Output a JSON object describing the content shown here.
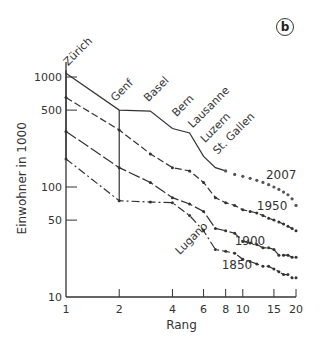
{
  "panel_label": "b",
  "chart_data": {
    "type": "line",
    "title": "",
    "xlabel": "Rang",
    "ylabel": "Einwohner in 1000",
    "x_scale": "log",
    "y_scale": "log",
    "xlim": [
      1,
      20
    ],
    "ylim": [
      10,
      1000
    ],
    "grid": false,
    "x_ticks": [
      1,
      2,
      4,
      6,
      8,
      10,
      15,
      20
    ],
    "x_tick_labels": [
      "1",
      "2",
      "4",
      "6",
      "8",
      "10",
      "15",
      "20"
    ],
    "y_ticks": [
      10,
      50,
      100,
      500,
      1000
    ],
    "y_tick_labels": [
      "10",
      "50",
      "100",
      "500",
      "1000"
    ],
    "x": [
      1,
      2,
      3,
      4,
      5,
      6,
      7,
      8,
      9,
      10,
      11,
      12,
      13,
      14,
      15,
      16,
      17,
      18,
      19,
      20
    ],
    "series": [
      {
        "name": "2007",
        "style": "solid-then-dotted",
        "values": [
          1080,
          500,
          490,
          340,
          310,
          190,
          150,
          140,
          130,
          125,
          120,
          115,
          110,
          105,
          100,
          95,
          90,
          85,
          78,
          68
        ]
      },
      {
        "name": "1950",
        "style": "dashed",
        "values": [
          650,
          330,
          200,
          150,
          140,
          110,
          80,
          72,
          68,
          62,
          60,
          58,
          55,
          52,
          50,
          48,
          46,
          44,
          42,
          40
        ]
      },
      {
        "name": "1900",
        "style": "long-dash",
        "values": [
          320,
          150,
          110,
          80,
          70,
          60,
          42,
          40,
          38,
          32,
          31,
          30,
          28,
          28,
          27,
          24,
          24,
          24,
          23,
          23
        ]
      },
      {
        "name": "1850",
        "style": "dash-dot",
        "values": [
          180,
          75,
          73,
          72,
          55,
          40,
          27,
          26,
          25,
          22,
          21,
          20,
          19,
          19,
          18,
          17,
          16,
          16,
          15,
          15
        ]
      }
    ],
    "city_labels": [
      "Zürich",
      "Genf",
      "Basel",
      "Bern",
      "Lausanne",
      "Luzern",
      "St. Gallen",
      "Lugano"
    ],
    "series_labels": [
      "2007",
      "1950",
      "1900",
      "1850"
    ]
  }
}
